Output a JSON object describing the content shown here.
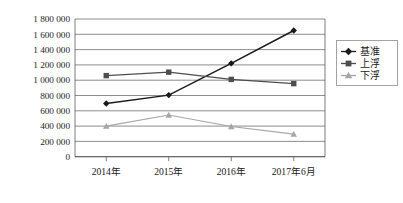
{
  "chart_data": {
    "type": "line",
    "title": "",
    "subtitle": "",
    "xlabel": "",
    "ylabel": "",
    "categories": [
      "2014年",
      "2015年",
      "2016年",
      "2017年6月"
    ],
    "series": [
      {
        "name": "基准",
        "values": [
          695000,
          805000,
          1220000,
          1650000
        ],
        "color": "#1a1a1a",
        "marker": "diamond"
      },
      {
        "name": "上浮",
        "values": [
          1060000,
          1105000,
          1010000,
          955000
        ],
        "color": "#4d4d4d",
        "marker": "square"
      },
      {
        "name": "下浮",
        "values": [
          400000,
          545000,
          395000,
          295000
        ],
        "color": "#a6a6a6",
        "marker": "triangle"
      }
    ],
    "ylim": [
      0,
      1800000
    ],
    "ytick_step": 200000,
    "ytick_labels": [
      "0",
      "200 000",
      "400 000",
      "600 000",
      "800 000",
      "1 000 000",
      "1 200 000",
      "1 400 000",
      "1 600 000",
      "1 800 000"
    ],
    "ytick_values": [
      0,
      200000,
      400000,
      600000,
      800000,
      1000000,
      1200000,
      1400000,
      1600000,
      1800000
    ],
    "grid": true,
    "grid_axis": "y",
    "legend_position": "right",
    "legend_entries": [
      "基准",
      "上浮",
      "下浮"
    ]
  },
  "colors": {
    "baseline_series": "#1a1a1a",
    "up_series": "#4d4d4d",
    "down_series": "#a6a6a6",
    "gridline": "#808080",
    "frame": "#6e6e6e",
    "legend_border": "#9a9a9a",
    "background": "#ffffff"
  }
}
